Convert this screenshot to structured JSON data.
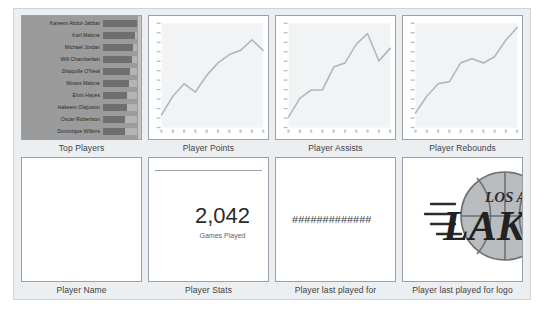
{
  "report": {
    "background_color": "#eceff1",
    "tile_border_color": "#9aa0a6"
  },
  "tiles": {
    "top_players": {
      "label": "Top Players",
      "list_background": "#9b9b9b",
      "bar_color": "#6f6f6f",
      "rows": [
        {
          "name": "Kareem Abdul-Jabbar",
          "bar_pct": 100
        },
        {
          "name": "Karl Malone",
          "bar_pct": 94
        },
        {
          "name": "Michael Jordan",
          "bar_pct": 88
        },
        {
          "name": "Wilt Chamberlain",
          "bar_pct": 86
        },
        {
          "name": "Shaquille O'Neal",
          "bar_pct": 78
        },
        {
          "name": "Moses Malone",
          "bar_pct": 76
        },
        {
          "name": "Elvin Hayes",
          "bar_pct": 72
        },
        {
          "name": "Hakeem Olajuwon",
          "bar_pct": 70
        },
        {
          "name": "Oscar Robertson",
          "bar_pct": 66
        },
        {
          "name": "Dominique Wilkins",
          "bar_pct": 65
        }
      ]
    },
    "player_points": {
      "label": "Player Points"
    },
    "player_assists": {
      "label": "Player Assists"
    },
    "player_rebounds": {
      "label": "Player Rebounds"
    },
    "player_name": {
      "label": "Player Name"
    },
    "player_stats": {
      "label": "Player Stats",
      "value": "2,042",
      "caption": "Games Played"
    },
    "player_last_played_for": {
      "label": "Player last played for",
      "value": "#############"
    },
    "player_last_played_for_logo": {
      "label": "Player last played for logo",
      "logo_name": "los-angeles-lakers-logo",
      "logo_text_top": "LOS A",
      "logo_text_main": "LAKE"
    }
  },
  "chart_data": [
    {
      "type": "line",
      "title": "Player Points",
      "xlabel": "",
      "ylabel": "",
      "x": [
        1,
        2,
        3,
        4,
        5,
        6,
        7,
        8,
        9,
        10
      ],
      "values": [
        12,
        30,
        42,
        34,
        50,
        62,
        70,
        74,
        84,
        74
      ],
      "ylim": [
        0,
        100
      ],
      "grid": false,
      "legend": "none",
      "line_color": "#b0b6bb"
    },
    {
      "type": "line",
      "title": "Player Assists",
      "xlabel": "",
      "ylabel": "",
      "x": [
        1,
        2,
        3,
        4,
        5,
        6,
        7,
        8,
        9,
        10
      ],
      "values": [
        10,
        28,
        36,
        36,
        58,
        62,
        80,
        90,
        64,
        76
      ],
      "ylim": [
        0,
        100
      ],
      "grid": false,
      "legend": "none",
      "line_color": "#b0b6bb"
    },
    {
      "type": "line",
      "title": "Player Rebounds",
      "xlabel": "",
      "ylabel": "",
      "x": [
        1,
        2,
        3,
        4,
        5,
        6,
        7,
        8,
        9,
        10
      ],
      "values": [
        14,
        30,
        42,
        44,
        62,
        66,
        62,
        68,
        84,
        96
      ],
      "ylim": [
        0,
        100
      ],
      "grid": false,
      "legend": "none",
      "line_color": "#b0b6bb"
    }
  ]
}
